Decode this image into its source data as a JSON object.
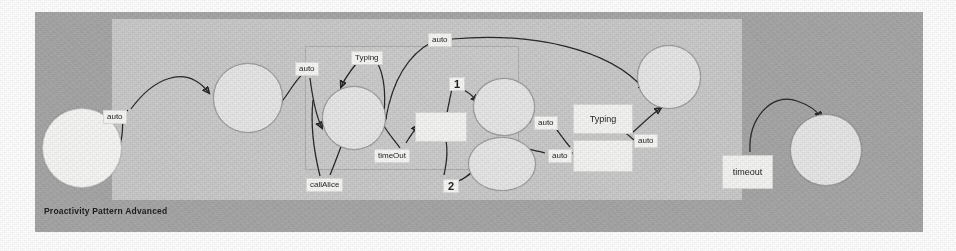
{
  "figure": {
    "caption": "Proactivity Pattern Advanced",
    "type": "state-machine-diagram"
  },
  "colors": {
    "outer_frame": "#a5a5a5",
    "inner_panel": "#c9c9c9",
    "node_fill": "#e6e6e6",
    "node_bright_fill": "#f6f6f4",
    "box_fill": "#f4f4f2",
    "label_fill": "#f7f7f5",
    "edge_stroke": "#242424"
  },
  "nodes": [
    {
      "id": "n1",
      "label": "",
      "shape": "circle",
      "x": 42,
      "y": 108,
      "w": 78,
      "h": 78,
      "bright": true
    },
    {
      "id": "n2",
      "label": "",
      "shape": "circle",
      "x": 213,
      "y": 63,
      "w": 68,
      "h": 68,
      "bright": false
    },
    {
      "id": "n3",
      "label": "",
      "shape": "circle",
      "x": 322,
      "y": 86,
      "w": 62,
      "h": 62,
      "bright": false
    },
    {
      "id": "n4",
      "label": "",
      "shape": "circle",
      "x": 473,
      "y": 78,
      "w": 60,
      "h": 56,
      "bright": false
    },
    {
      "id": "n5",
      "label": "",
      "shape": "ellipse",
      "x": 468,
      "y": 137,
      "w": 66,
      "h": 52,
      "bright": false
    },
    {
      "id": "n6",
      "label": "",
      "shape": "circle",
      "x": 637,
      "y": 45,
      "w": 62,
      "h": 62,
      "bright": false
    },
    {
      "id": "n7",
      "label": "",
      "shape": "circle",
      "x": 790,
      "y": 114,
      "w": 70,
      "h": 70,
      "bright": false
    }
  ],
  "boxes": [
    {
      "id": "b1",
      "label": "",
      "x": 415,
      "y": 112,
      "w": 50,
      "h": 28
    },
    {
      "id": "b2",
      "label": "Typing",
      "x": 573,
      "y": 104,
      "w": 58,
      "h": 28
    },
    {
      "id": "b3",
      "label": "",
      "x": 573,
      "y": 140,
      "w": 58,
      "h": 30
    },
    {
      "id": "b4",
      "label": "timeout",
      "x": 722,
      "y": 155,
      "w": 49,
      "h": 32
    }
  ],
  "edge_labels": [
    {
      "id": "l1",
      "text": "auto",
      "x": 103,
      "y": 110,
      "kind": "text"
    },
    {
      "id": "l2",
      "text": "auto",
      "x": 295,
      "y": 62,
      "kind": "text"
    },
    {
      "id": "l3",
      "text": "Typing",
      "x": 351,
      "y": 51,
      "kind": "text"
    },
    {
      "id": "l4",
      "text": "auto",
      "x": 428,
      "y": 33,
      "kind": "text"
    },
    {
      "id": "l5",
      "text": "callAlice",
      "x": 306,
      "y": 178,
      "kind": "text"
    },
    {
      "id": "l6",
      "text": "timeOut",
      "x": 374,
      "y": 149,
      "kind": "text"
    },
    {
      "id": "l7",
      "text": "1",
      "x": 449,
      "y": 77,
      "kind": "number"
    },
    {
      "id": "l8",
      "text": "2",
      "x": 443,
      "y": 179,
      "kind": "number"
    },
    {
      "id": "l9",
      "text": "auto",
      "x": 534,
      "y": 116,
      "kind": "text"
    },
    {
      "id": "l10",
      "text": "auto",
      "x": 548,
      "y": 149,
      "kind": "text"
    },
    {
      "id": "l11",
      "text": "auto",
      "x": 634,
      "y": 134,
      "kind": "text"
    }
  ],
  "edges": [
    {
      "id": "e1",
      "from": "n1",
      "to": "n2",
      "label": "auto"
    },
    {
      "id": "e2",
      "from": "n2",
      "to": "n3",
      "label": "auto"
    },
    {
      "id": "e3",
      "from": "l3",
      "to": "n3",
      "label": "Typing"
    },
    {
      "id": "e4",
      "from": "n3",
      "to": "n3",
      "label": "callAlice"
    },
    {
      "id": "e5",
      "from": "n3",
      "to": "b1",
      "label": "timeOut"
    },
    {
      "id": "e6",
      "from": "n3",
      "to": "n6",
      "label": "auto"
    },
    {
      "id": "e7",
      "from": "b1",
      "to": "n4",
      "label": "1"
    },
    {
      "id": "e8",
      "from": "b1",
      "to": "n5",
      "label": "2"
    },
    {
      "id": "e9",
      "from": "n4",
      "to": "b3",
      "label": "auto"
    },
    {
      "id": "e10",
      "from": "n5",
      "to": "b3",
      "label": "auto"
    },
    {
      "id": "e11",
      "from": "b2",
      "to": "n6",
      "label": "auto"
    },
    {
      "id": "e12",
      "from": "b4",
      "to": "n7",
      "label": "timeout"
    }
  ]
}
